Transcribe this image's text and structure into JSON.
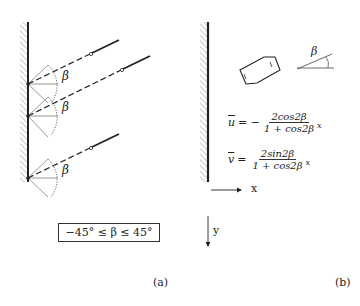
{
  "panel_a": {
    "label": "(a)",
    "angle_symbol": "β",
    "range_text": "−45° ≤ β ≤ 45°",
    "fiber_count": 3
  },
  "panel_b": {
    "label": "(b)",
    "angle_symbol": "β",
    "equation_u": {
      "lhs": "u",
      "eq": "= −",
      "numerator": "2cos2β",
      "denominator": "1 + cos2β",
      "var": "x"
    },
    "equation_v": {
      "lhs": "v",
      "eq": "=",
      "numerator": "2sin2β",
      "denominator": "1 + cos2β",
      "var": "x"
    },
    "x_axis_label": "x",
    "y_axis_label": "y"
  },
  "colors": {
    "ink": "#222222",
    "hatch": "#777777",
    "background": "#ffffff"
  }
}
